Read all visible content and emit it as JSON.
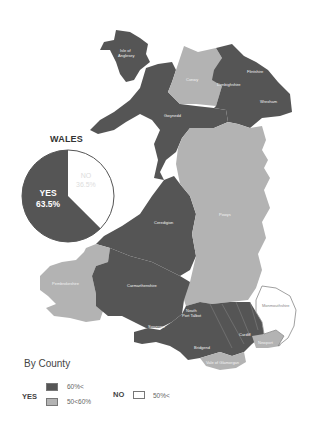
{
  "title": "WALES",
  "national_result": {
    "yes_label": "YES",
    "yes_pct": "63.5%",
    "no_label": "NO",
    "no_pct": "36.5%"
  },
  "legend": {
    "title": "By County",
    "yes_label": "YES",
    "no_label": "NO",
    "items": [
      {
        "group": "YES",
        "range": "60%<",
        "color": "#555555"
      },
      {
        "group": "YES",
        "range": "50<60%",
        "color": "#b3b3b3"
      },
      {
        "group": "NO",
        "range": "50%<",
        "color": "#ffffff"
      }
    ]
  },
  "counties": [
    {
      "name": "Isle of Anglesey",
      "category": "YES 60%<"
    },
    {
      "name": "Conwy",
      "category": "YES 50<60%"
    },
    {
      "name": "Denbighshire",
      "category": "YES 60%<"
    },
    {
      "name": "Flintshire",
      "category": "YES 60%<"
    },
    {
      "name": "Wrexham",
      "category": "YES 60%<"
    },
    {
      "name": "Gwynedd",
      "category": "YES 60%<"
    },
    {
      "name": "Ceredigion",
      "category": "YES 60%<"
    },
    {
      "name": "Powys",
      "category": "YES 50<60%"
    },
    {
      "name": "Pembrokeshire",
      "category": "YES 50<60%"
    },
    {
      "name": "Carmarthenshire",
      "category": "YES 60%<"
    },
    {
      "name": "Swansea",
      "category": "YES 60%<"
    },
    {
      "name": "Neath Port Talbot",
      "category": "YES 60%<"
    },
    {
      "name": "Bridgend",
      "category": "YES 60%<"
    },
    {
      "name": "Rhondda Cynon Taf",
      "category": "YES 60%<"
    },
    {
      "name": "Merthyr Tydfil",
      "category": "YES 60%<"
    },
    {
      "name": "Caerphilly",
      "category": "YES 60%<"
    },
    {
      "name": "Blaenau Gwent",
      "category": "YES 60%<"
    },
    {
      "name": "Torfaen",
      "category": "YES 60%<"
    },
    {
      "name": "Cardiff",
      "category": "YES 60%<"
    },
    {
      "name": "Vale of Glamorgan",
      "category": "YES 50<60%"
    },
    {
      "name": "Newport",
      "category": "YES 50<60%"
    },
    {
      "name": "Monmouthshire",
      "category": "NO 50%<"
    }
  ],
  "colors": {
    "yes_high": "#555555",
    "yes_mid": "#b3b3b3",
    "no": "#ffffff",
    "outline": "#888888"
  }
}
